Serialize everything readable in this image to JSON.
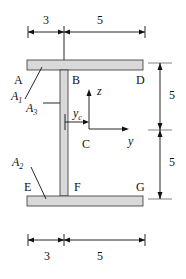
{
  "diagram": {
    "title": "",
    "dimensions": {
      "top": [
        "3",
        "5"
      ],
      "bottom": [
        "3",
        "5"
      ],
      "right": [
        "5",
        "5"
      ]
    },
    "points": {
      "A": "A",
      "B": "B",
      "C": "C",
      "D": "D",
      "E": "E",
      "F": "F",
      "G": "G"
    },
    "areas": {
      "A1": {
        "base": "A",
        "sub": "1"
      },
      "A2": {
        "base": "A",
        "sub": "2"
      },
      "A3": {
        "base": "A",
        "sub": "3"
      }
    },
    "centroid_offset": {
      "base": "y",
      "sub": "c"
    },
    "axes": {
      "y": "y",
      "z": "z"
    },
    "colors": {
      "section_fill": "#d9d9d9",
      "line": "#111111"
    }
  }
}
